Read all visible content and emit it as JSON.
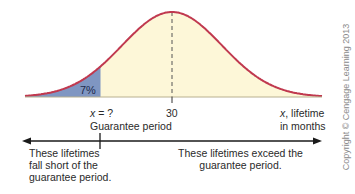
{
  "figure": {
    "shaded_percent_label": "7%",
    "x_question_label_var": "x",
    "x_question_label_rest": " = ?",
    "guarantee_label": "Guarantee period",
    "mean_label": "30",
    "axis_label_var": "x",
    "axis_label_line1_rest": ", lifetime",
    "axis_label_line2": "in months",
    "left_note": [
      "These lifetimes",
      "fall short of the",
      "guarantee period."
    ],
    "right_note": [
      "These lifetimes exceed the",
      "guarantee period."
    ],
    "copyright": "Copyright © Cengage Learning 2013",
    "colors": {
      "curve": "#c0394f",
      "under_curve_fill": "#fdf7d8",
      "shaded_tail": "#7f96c2",
      "axis": "#1a1a1a",
      "dashed_mean": "#555555"
    }
  },
  "chart_data": {
    "type": "area",
    "xlabel": "x, lifetime in months",
    "ylabel": "",
    "distribution": "normal",
    "mean": 30,
    "lower_tail_area_percent": 7,
    "tick_labels": [
      "x = ?",
      "30"
    ],
    "annotations": [
      "7%",
      "Guarantee period",
      "These lifetimes fall short of the guarantee period.",
      "These lifetimes exceed the guarantee period."
    ]
  }
}
